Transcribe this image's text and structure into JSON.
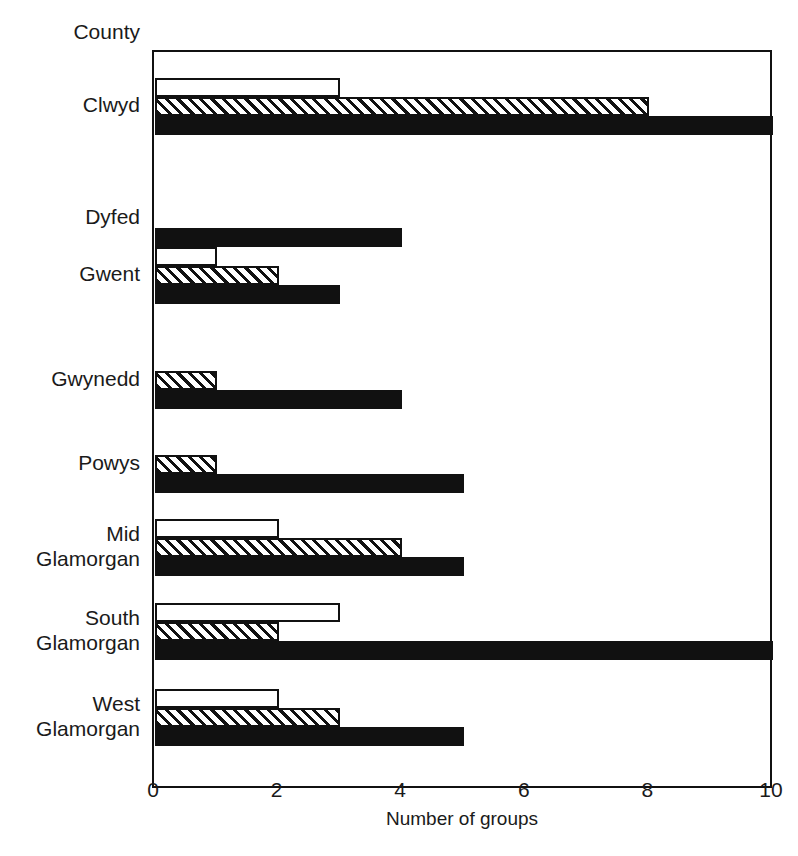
{
  "chart_data": {
    "type": "bar",
    "orientation": "horizontal",
    "title": "",
    "xlabel": "Number of groups",
    "ylabel": "County",
    "xlim": [
      0,
      10
    ],
    "xticks": [
      0,
      2,
      4,
      6,
      8,
      10
    ],
    "grid": false,
    "legend": "none",
    "categories": [
      "Clwyd",
      "Dyfed",
      "Gwent",
      "Gwynedd",
      "Powys",
      "Mid\nGlamorgan",
      "South\nGlamorgan",
      "West\nGlamorgan"
    ],
    "series": [
      {
        "name": "white",
        "style": "open",
        "values": [
          3,
          0,
          1,
          0,
          0,
          2,
          3,
          2
        ]
      },
      {
        "name": "hatched",
        "style": "diagonal-hatch",
        "values": [
          8,
          0,
          2,
          1,
          1,
          4,
          2,
          3
        ]
      },
      {
        "name": "black",
        "style": "solid",
        "values": [
          10,
          4,
          3,
          4,
          5,
          5,
          10,
          5
        ]
      }
    ]
  },
  "colors": {
    "ink": "#111111",
    "background": "#ffffff"
  }
}
